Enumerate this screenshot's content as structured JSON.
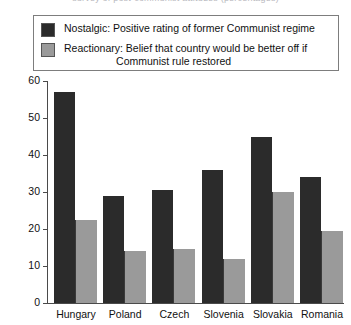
{
  "title_remnant": "survey of post-communist attitudes (percentages)",
  "legend": {
    "position": "top",
    "entries": [
      {
        "swatch": "dark-swatch",
        "color": "#2b2b2b",
        "line1": "Nostalgic: Positive rating of former Communist regime",
        "line2": ""
      },
      {
        "swatch": "light-swatch",
        "color": "#9a9a9a",
        "line1": "Reactionary: Belief that country would be better off if",
        "line2": "Communist rule restored"
      }
    ]
  },
  "axis": {
    "y_title": "Percentage",
    "y_ticks": [
      "60",
      "50",
      "40",
      "30",
      "20",
      "10",
      "0"
    ]
  },
  "chart_data": {
    "type": "bar",
    "title": "",
    "subtitle": "",
    "xlabel": "",
    "ylabel": "Percentage",
    "ylim": [
      0,
      60
    ],
    "ytick_step": 10,
    "grid": false,
    "legend_position": "top",
    "categories": [
      "Hungary",
      "Poland",
      "Czech",
      "Slovenia",
      "Slovakia",
      "Romania"
    ],
    "series": [
      {
        "name": "Nostalgic: Positive rating of former Communist regime",
        "short_name": "Nostalgic",
        "color": "#2b2b2b",
        "values": [
          57,
          29,
          30.5,
          36,
          45,
          34
        ]
      },
      {
        "name": "Reactionary: Belief that country would be better off if Communist rule restored",
        "short_name": "Reactionary",
        "color": "#9a9a9a",
        "values": [
          22.5,
          14,
          14.5,
          12,
          30,
          19.5
        ]
      }
    ]
  }
}
